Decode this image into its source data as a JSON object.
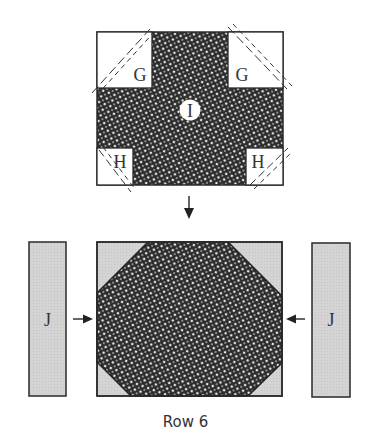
{
  "caption": "Row 6",
  "colors": {
    "outline": "#2a2a2a",
    "print_dark": "#2b2b2b",
    "print_light": "#e8e8e8",
    "strip_fill": "#d4d4d4",
    "white": "#ffffff"
  },
  "top_block": {
    "pieces": [
      {
        "label": "G",
        "position": "top-left"
      },
      {
        "label": "G",
        "position": "top-right"
      },
      {
        "label": "I",
        "position": "center"
      },
      {
        "label": "H",
        "position": "bottom-left"
      },
      {
        "label": "H",
        "position": "bottom-right"
      }
    ]
  },
  "bottom_row": {
    "left_strip": {
      "label": "J"
    },
    "center": {
      "shape": "octagon"
    },
    "right_strip": {
      "label": "J"
    }
  },
  "labels": {
    "g_left": "G",
    "g_right": "G",
    "i_center": "I",
    "h_left": "H",
    "h_right": "H",
    "j_left": "J",
    "j_right": "J"
  }
}
